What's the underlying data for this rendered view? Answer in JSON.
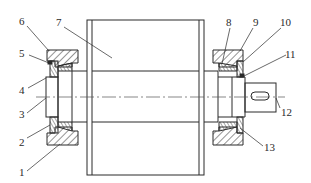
{
  "diagram": {
    "type": "mechanical-section-drawing",
    "colors": {
      "stroke": "#2a2a2a",
      "hatch": "#3a3a3a",
      "centerline": "#555555",
      "background": "#ffffff"
    },
    "labels": [
      {
        "id": "1",
        "text": "1"
      },
      {
        "id": "2",
        "text": "2"
      },
      {
        "id": "3",
        "text": "3"
      },
      {
        "id": "4",
        "text": "4"
      },
      {
        "id": "5",
        "text": "5"
      },
      {
        "id": "6",
        "text": "6"
      },
      {
        "id": "7",
        "text": "7"
      },
      {
        "id": "8",
        "text": "8"
      },
      {
        "id": "9",
        "text": "9"
      },
      {
        "id": "10",
        "text": "10"
      },
      {
        "id": "11",
        "text": "11"
      },
      {
        "id": "12",
        "text": "12"
      },
      {
        "id": "13",
        "text": "13"
      }
    ]
  }
}
